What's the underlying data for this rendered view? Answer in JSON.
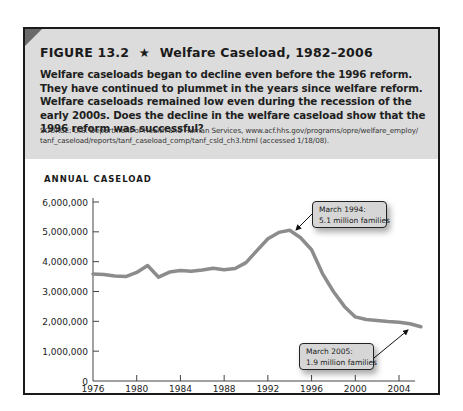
{
  "figure": {
    "number_label": "FIGURE 13.2",
    "star": "★",
    "title": "Welfare Caseload, 1982–2006",
    "caption": "Welfare caseloads began to decline even before the 1996 reform. They have continued to plummet in the years since welfare reform. Welfare caseloads remained low even during the recession of the early 2000s. Does the decline in the welfare caseload show that the 1996 reform was successful?",
    "source_line1": "SOURCE: U.S. Department of Health and Human Services, www.acf.hhs.gov/programs/opre/welfare_employ/",
    "source_line2": "tanf_caseload/reports/tanf_caseload_comp/tanf_csld_ch3.html  (accessed 1/18/08).",
    "colors": {
      "header_bg": "#dcdcdc",
      "line": "#8c8c8c",
      "border": "#1a1a1a",
      "callout_bg": "#d6d6d6"
    }
  },
  "callouts": [
    {
      "line1": "March 1994:",
      "line2": "5.1 million families"
    },
    {
      "line1": "March 2005:",
      "line2": "1.9 million families"
    }
  ],
  "chart_data": {
    "type": "line",
    "title": "Welfare Caseload, 1982–2006",
    "ylabel": "ANNUAL CASELOAD",
    "xlabel": "",
    "ylim": [
      0,
      6000000
    ],
    "xlim": [
      1976,
      2006
    ],
    "y_ticks": [
      "6,000,000",
      "5,000,000",
      "4,000,000",
      "3,000,000",
      "2,000,000",
      "1,000,000",
      "0"
    ],
    "x_ticks": [
      "1976",
      "1980",
      "1984",
      "1988",
      "1992",
      "1996",
      "2000",
      "2004"
    ],
    "grid": false,
    "legend": null,
    "series": [
      {
        "name": "Annual caseload (families)",
        "x": [
          1976,
          1977,
          1978,
          1979,
          1980,
          1981,
          1982,
          1983,
          1984,
          1985,
          1986,
          1987,
          1988,
          1989,
          1990,
          1991,
          1992,
          1993,
          1994,
          1995,
          1996,
          1997,
          1998,
          1999,
          2000,
          2001,
          2002,
          2003,
          2004,
          2005,
          2006
        ],
        "values": [
          3590000,
          3570000,
          3520000,
          3500000,
          3640000,
          3870000,
          3480000,
          3650000,
          3700000,
          3680000,
          3720000,
          3780000,
          3730000,
          3770000,
          3970000,
          4370000,
          4770000,
          4980000,
          5050000,
          4800000,
          4400000,
          3600000,
          3000000,
          2500000,
          2150000,
          2060000,
          2030000,
          1990000,
          1970000,
          1920000,
          1820000
        ]
      }
    ],
    "annotations": [
      {
        "text": "March 1994: 5.1 million families",
        "x": 1994.2,
        "y": 5100000
      },
      {
        "text": "March 2005: 1.9 million families",
        "x": 2005.2,
        "y": 1900000
      }
    ]
  }
}
